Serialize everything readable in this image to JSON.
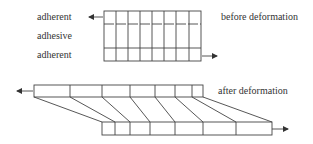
{
  "labels": {
    "top_adherent": "adherent",
    "adhesive": "adhesive",
    "bottom_adherent": "adherent",
    "before": "before deformation",
    "after": "after deformation"
  },
  "colors": {
    "line": "#444444",
    "text": "#333333",
    "background": "#ffffff"
  }
}
